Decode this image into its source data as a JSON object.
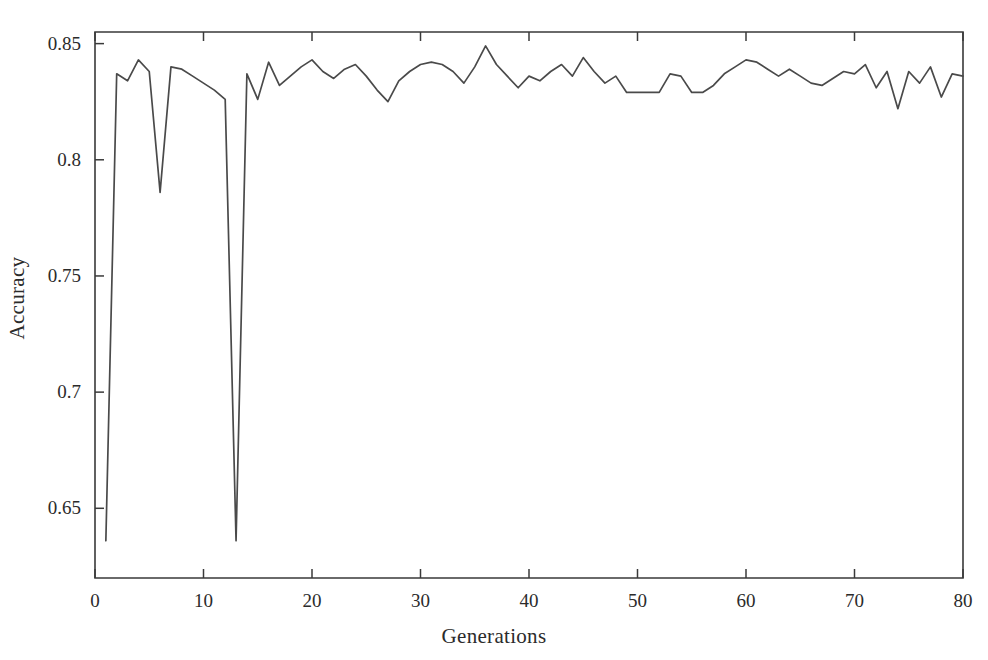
{
  "chart_data": {
    "type": "line",
    "title": "",
    "subtitle": "",
    "xlabel": "Generations",
    "ylabel": "Accuracy",
    "xlim": [
      0,
      80
    ],
    "ylim": [
      0.62,
      0.855
    ],
    "grid": false,
    "legend": null,
    "legend_position": "none",
    "line_color": "#4a4a4a",
    "axis_color": "#3a3a3a",
    "background_color": "#ffffff",
    "xticks": [
      0,
      10,
      20,
      30,
      40,
      50,
      60,
      70,
      80
    ],
    "xtick_labels": [
      "0",
      "10",
      "20",
      "30",
      "40",
      "50",
      "60",
      "70",
      "80"
    ],
    "yticks": [
      0.65,
      0.7,
      0.75,
      0.8,
      0.85
    ],
    "ytick_labels": [
      "0.65",
      "0.7",
      "0.75",
      "0.8",
      "0.85"
    ],
    "series": [
      {
        "name": "Accuracy",
        "x": [
          1,
          2,
          3,
          4,
          5,
          6,
          7,
          8,
          9,
          10,
          11,
          12,
          13,
          14,
          15,
          16,
          17,
          18,
          19,
          20,
          21,
          22,
          23,
          24,
          25,
          26,
          27,
          28,
          29,
          30,
          31,
          32,
          33,
          34,
          35,
          36,
          37,
          38,
          39,
          40,
          41,
          42,
          43,
          44,
          45,
          46,
          47,
          48,
          49,
          50,
          51,
          52,
          53,
          54,
          55,
          56,
          57,
          58,
          59,
          60,
          61,
          62,
          63,
          64,
          65,
          66,
          67,
          68,
          69,
          70,
          71,
          72,
          73,
          74,
          75,
          76,
          77,
          78,
          79,
          80
        ],
        "values": [
          0.636,
          0.837,
          0.834,
          0.843,
          0.838,
          0.786,
          0.84,
          0.839,
          0.836,
          0.833,
          0.83,
          0.826,
          0.636,
          0.837,
          0.826,
          0.842,
          0.832,
          0.836,
          0.84,
          0.843,
          0.838,
          0.835,
          0.839,
          0.841,
          0.836,
          0.83,
          0.825,
          0.834,
          0.838,
          0.841,
          0.842,
          0.841,
          0.838,
          0.833,
          0.84,
          0.849,
          0.841,
          0.836,
          0.831,
          0.836,
          0.834,
          0.838,
          0.841,
          0.836,
          0.844,
          0.838,
          0.833,
          0.836,
          0.829,
          0.829,
          0.829,
          0.829,
          0.837,
          0.836,
          0.829,
          0.829,
          0.832,
          0.837,
          0.84,
          0.843,
          0.842,
          0.839,
          0.836,
          0.839,
          0.836,
          0.833,
          0.832,
          0.835,
          0.838,
          0.837,
          0.841,
          0.831,
          0.838,
          0.822,
          0.838,
          0.833,
          0.84,
          0.827,
          0.837,
          0.836
        ]
      }
    ]
  },
  "axes": {
    "xlabel": "Generations",
    "ylabel": "Accuracy"
  }
}
